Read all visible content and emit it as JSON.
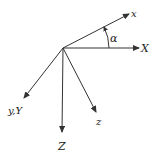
{
  "diagram": {
    "type": "coordinate-axes",
    "line_color": "#333333",
    "origin": {
      "x": 63,
      "y": 48
    },
    "axes": [
      {
        "id": "x",
        "label": "x",
        "tip": {
          "x": 129,
          "y": 14
        },
        "label_pos": {
          "x": 131,
          "y": 17
        },
        "font_size": 10
      },
      {
        "id": "X",
        "label": "X",
        "tip": {
          "x": 139,
          "y": 48
        },
        "label_pos": {
          "x": 141,
          "y": 52
        },
        "font_size": 11
      },
      {
        "id": "yY",
        "label": "y,Y",
        "tip": {
          "x": 24,
          "y": 98
        },
        "label_pos": {
          "x": 8,
          "y": 114
        },
        "font_size": 10
      },
      {
        "id": "Z",
        "label": "Z",
        "tip": {
          "x": 62,
          "y": 132
        },
        "label_pos": {
          "x": 58,
          "y": 150
        },
        "font_size": 11
      },
      {
        "id": "z",
        "label": "z",
        "tip": {
          "x": 96,
          "y": 112
        },
        "label_pos": {
          "x": 96,
          "y": 125
        },
        "font_size": 10
      }
    ],
    "angle": {
      "label": "α",
      "label_pos": {
        "x": 110,
        "y": 42
      },
      "font_size": 11,
      "radius": 46,
      "from_deg": -27,
      "to_deg": 0
    }
  }
}
